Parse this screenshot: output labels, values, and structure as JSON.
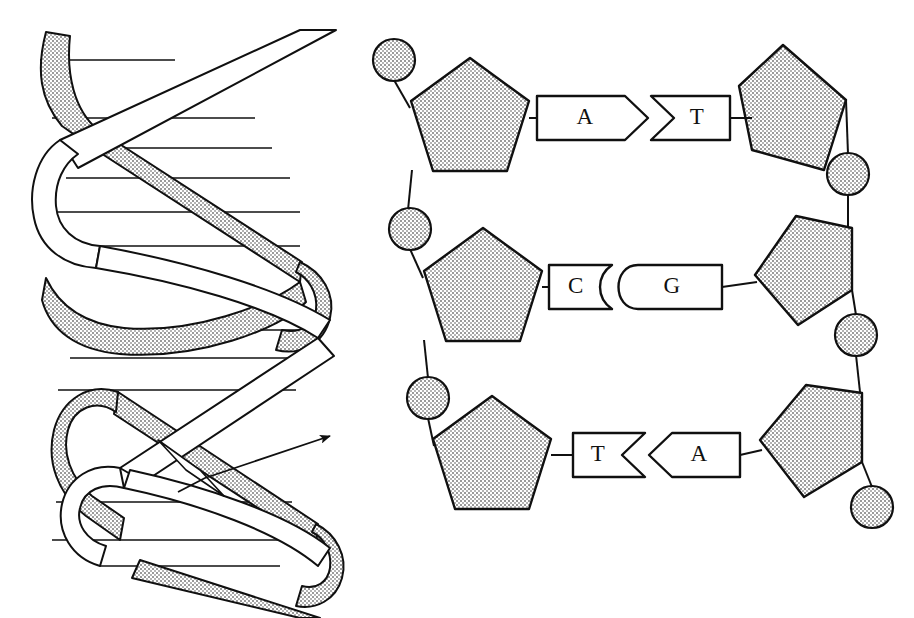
{
  "figure": {
    "background_color": "#ffffff",
    "ink_color": "#101010",
    "fill_gray": "#c9c9c9",
    "stipple_dot": "#8c8c8c",
    "width": 914,
    "height": 618
  },
  "panels": {
    "left": {
      "name": "double-helix-illustration",
      "description": "Three-dimensional ribbon model of the DNA double helix",
      "ribbon_shaded_label": "shaded backbone ribbon",
      "ribbon_white_label": "white backbone ribbon",
      "rung_label": "base-pair rung",
      "turns": 3,
      "rung_count": 12,
      "annotation": {
        "name": "pointer-arrow",
        "label": "",
        "target": "white backbone ribbon",
        "tail_x": 178,
        "tail_y": 492,
        "elbow_x": 205,
        "elbow_y": 478,
        "tip_x": 334,
        "tip_y": 434
      }
    },
    "right": {
      "name": "base-pair-ladder",
      "description": "Flattened ladder showing sugar-phosphate backbones and three complementary base pairs",
      "sugar_label": "deoxyribose sugar",
      "phosphate_label": "phosphate group",
      "strand_left_label": "left strand",
      "strand_right_label": "right strand",
      "rungs": [
        {
          "id": "rung-1",
          "left_base": "A",
          "right_base": "T",
          "joint": "chevron",
          "joint_direction": "right",
          "y": 118,
          "left_base_x": 590,
          "right_base_x": 688,
          "left_box": {
            "x": 537,
            "y": 95,
            "width": 110,
            "height": 45
          },
          "right_box": {
            "x": 645,
            "y": 95,
            "width": 85,
            "height": 45
          }
        },
        {
          "id": "rung-2",
          "left_base": "C",
          "right_base": "G",
          "joint": "rounded",
          "joint_direction": "right",
          "y": 287,
          "left_base_x": 574,
          "right_base_x": 663,
          "left_box": {
            "x": 548,
            "y": 265,
            "width": 62,
            "height": 45
          },
          "right_box": {
            "x": 605,
            "y": 265,
            "width": 115,
            "height": 45
          }
        },
        {
          "id": "rung-3",
          "left_base": "T",
          "right_base": "A",
          "joint": "chevron",
          "joint_direction": "left",
          "y": 455,
          "left_base_x": 597,
          "right_base_x": 680,
          "left_box": {
            "x": 572,
            "y": 432,
            "width": 70,
            "height": 45
          },
          "right_box": {
            "x": 633,
            "y": 432,
            "width": 105,
            "height": 45
          }
        }
      ],
      "left_sugars": [
        {
          "id": "sugar-left-1",
          "cx": 470,
          "cy": 120,
          "r": 62
        },
        {
          "id": "sugar-left-2",
          "cx": 481,
          "cy": 290,
          "r": 62
        },
        {
          "id": "sugar-left-3",
          "cx": 488,
          "cy": 458,
          "r": 62
        }
      ],
      "right_sugars": [
        {
          "id": "sugar-right-1",
          "cx": 790,
          "cy": 110,
          "r": 62
        },
        {
          "id": "sugar-right-2",
          "cx": 800,
          "cy": 283,
          "r": 62
        },
        {
          "id": "sugar-right-3",
          "cx": 805,
          "cy": 450,
          "r": 62
        }
      ],
      "left_phosphates": [
        {
          "id": "phosphate-left-1",
          "cx": 394,
          "cy": 60,
          "r": 20
        },
        {
          "id": "phosphate-left-2",
          "cx": 410,
          "cy": 229,
          "r": 20
        },
        {
          "id": "phosphate-left-3",
          "cx": 428,
          "cy": 398,
          "r": 20
        }
      ],
      "right_phosphates": [
        {
          "id": "phosphate-right-1",
          "cx": 848,
          "cy": 174,
          "r": 20
        },
        {
          "id": "phosphate-right-2",
          "cx": 856,
          "cy": 335,
          "r": 20
        },
        {
          "id": "phosphate-right-3",
          "cx": 872,
          "cy": 507,
          "r": 20
        }
      ]
    }
  }
}
